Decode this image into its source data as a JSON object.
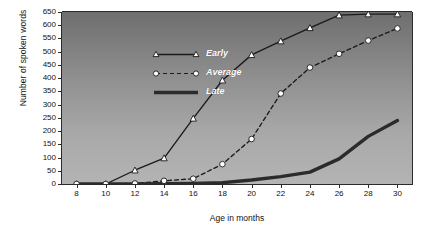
{
  "chart_data": {
    "type": "line",
    "title": "",
    "xlabel": "Age in months",
    "ylabel": "Number of spoken words",
    "x": [
      8,
      10,
      12,
      14,
      16,
      18,
      20,
      22,
      24,
      26,
      28,
      30
    ],
    "xlim": [
      7,
      31
    ],
    "ylim": [
      0,
      650
    ],
    "xticks": [
      "8",
      "10",
      "12",
      "14",
      "16",
      "18",
      "20",
      "22",
      "24",
      "26",
      "28",
      "30"
    ],
    "yticks": [
      "0",
      "50",
      "100",
      "150",
      "200",
      "250",
      "300",
      "350",
      "400",
      "450",
      "500",
      "550",
      "600",
      "650"
    ],
    "grid": false,
    "legend_position": "upper-left-inside",
    "series": [
      {
        "name": "Early",
        "marker": "triangle",
        "linestyle": "solid",
        "color": "#1b1b1b",
        "values": [
          0,
          0,
          52,
          98,
          248,
          392,
          488,
          540,
          590,
          638,
          642,
          642
        ]
      },
      {
        "name": "Average",
        "marker": "circle",
        "linestyle": "dashed",
        "color": "#1b1b1b",
        "values": [
          0,
          0,
          2,
          12,
          20,
          75,
          170,
          342,
          440,
          492,
          542,
          588
        ]
      },
      {
        "name": "Late",
        "marker": "none",
        "linestyle": "solid-thick",
        "color": "#2b2b2b",
        "values": [
          0,
          0,
          0,
          1,
          2,
          5,
          15,
          28,
          45,
          95,
          180,
          240
        ]
      }
    ],
    "colors": {
      "plot_background_top": "#6e6e6e",
      "plot_background_bottom": "#b4b4b4",
      "axis": "#2b2b2b",
      "marker_fill": "#ffffff",
      "legend_text": "#ffffff",
      "page_background": "#ffffff"
    }
  }
}
